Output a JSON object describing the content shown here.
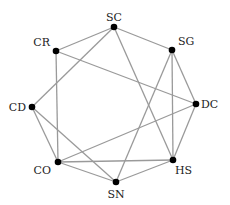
{
  "diagram": {
    "type": "graph",
    "colors": {
      "edge": "#9a9a9a",
      "node": "#000000",
      "label": "#222222"
    },
    "nodes": [
      {
        "id": "SC",
        "label": "SC",
        "x": 114,
        "y": 27,
        "lx": 114,
        "ly": 21,
        "anchor": "middle"
      },
      {
        "id": "SG",
        "label": "SG",
        "x": 172,
        "y": 50,
        "lx": 178,
        "ly": 45,
        "anchor": "start"
      },
      {
        "id": "DC",
        "label": "DC",
        "x": 196,
        "y": 104,
        "lx": 201,
        "ly": 108,
        "anchor": "start"
      },
      {
        "id": "HS",
        "label": "HS",
        "x": 173,
        "y": 160,
        "lx": 175,
        "ly": 174,
        "anchor": "start"
      },
      {
        "id": "SN",
        "label": "SN",
        "x": 116,
        "y": 182,
        "lx": 116,
        "ly": 198,
        "anchor": "middle"
      },
      {
        "id": "CO",
        "label": "CO",
        "x": 58,
        "y": 162,
        "lx": 51,
        "ly": 174,
        "anchor": "end"
      },
      {
        "id": "CD",
        "label": "CD",
        "x": 32,
        "y": 107,
        "lx": 26,
        "ly": 111,
        "anchor": "end"
      },
      {
        "id": "CR",
        "label": "CR",
        "x": 56,
        "y": 51,
        "lx": 50,
        "ly": 46,
        "anchor": "end"
      }
    ],
    "edges": [
      [
        "SC",
        "CR"
      ],
      [
        "SC",
        "SG"
      ],
      [
        "SC",
        "CD"
      ],
      [
        "SC",
        "HS"
      ],
      [
        "CR",
        "DC"
      ],
      [
        "CR",
        "CO"
      ],
      [
        "SG",
        "SN"
      ],
      [
        "SG",
        "HS"
      ],
      [
        "SG",
        "DC"
      ],
      [
        "DC",
        "HS"
      ],
      [
        "DC",
        "CO"
      ],
      [
        "CD",
        "CO"
      ],
      [
        "CD",
        "SN"
      ],
      [
        "CO",
        "HS"
      ],
      [
        "CO",
        "SN"
      ],
      [
        "SN",
        "HS"
      ]
    ]
  }
}
